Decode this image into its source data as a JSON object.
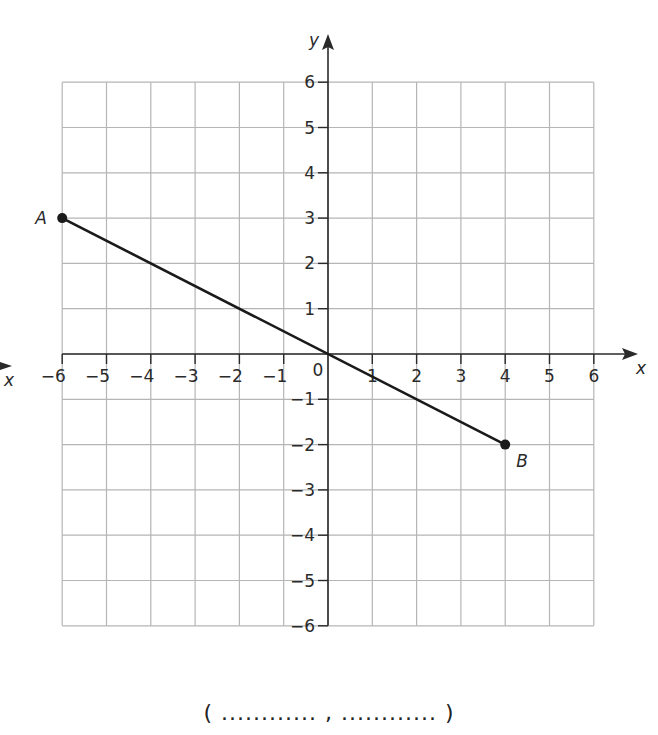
{
  "chart_data": {
    "type": "line",
    "title": "",
    "xlabel": "x",
    "ylabel": "y",
    "xlim": [
      -6,
      6
    ],
    "ylim": [
      -6,
      6
    ],
    "grid": true,
    "x_ticks": [
      "−6",
      "−5",
      "−4",
      "−3",
      "−2",
      "−1",
      "1",
      "2",
      "3",
      "4",
      "5",
      "6"
    ],
    "y_ticks": [
      "6",
      "5",
      "4",
      "3",
      "2",
      "1",
      "−1",
      "−2",
      "−3",
      "−4",
      "−5",
      "−6"
    ],
    "origin_label": "0",
    "series": [
      {
        "name": "segment AB",
        "points": [
          {
            "label": "A",
            "x": -6,
            "y": 3
          },
          {
            "label": "B",
            "x": 4,
            "y": -2
          }
        ]
      }
    ],
    "annotations": [
      "A",
      "B"
    ]
  },
  "axes": {
    "x_label": "x",
    "y_label": "y",
    "origin": "0",
    "left_x_label": "x"
  },
  "points": {
    "a_label": "A",
    "b_label": "B"
  },
  "answer": {
    "text": "( ............ , ............ )"
  },
  "colors": {
    "grid": "#b5b5b5",
    "axis": "#2a2a2a",
    "line": "#1a1a1a"
  }
}
